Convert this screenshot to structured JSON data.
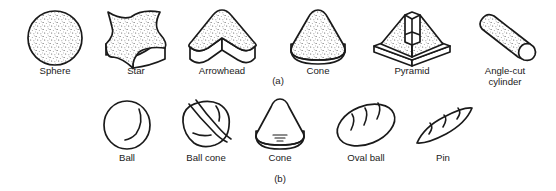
{
  "figure": {
    "background_color": "#ffffff",
    "ink_color": "#1a1a1a",
    "rows": [
      {
        "caption": "(a)",
        "caption_x": 278,
        "caption_y": 84,
        "shading": "stippled",
        "items": [
          {
            "label": "Sphere",
            "label_line2": "",
            "icon": "sphere-icon",
            "cx": 55,
            "label_y": 74
          },
          {
            "label": "Star",
            "label_line2": "",
            "icon": "extruded-star-icon",
            "cx": 136,
            "label_y": 74
          },
          {
            "label": "Arrowhead",
            "label_line2": "",
            "icon": "extruded-arrowhead-icon",
            "cx": 222,
            "label_y": 74
          },
          {
            "label": "Cone",
            "label_line2": "",
            "icon": "cone-on-base-icon",
            "cx": 318,
            "label_y": 74
          },
          {
            "label": "Pyramid",
            "label_line2": "",
            "icon": "truncated-pyramid-icon",
            "cx": 412,
            "label_y": 74
          },
          {
            "label": "Angle-cut",
            "label_line2": "cylinder",
            "icon": "angle-cut-cylinder-icon",
            "cx": 505,
            "label_y": 74
          }
        ]
      },
      {
        "caption": "(b)",
        "caption_y": 182,
        "shading": "outline",
        "items": [
          {
            "label": "Ball",
            "label_line2": "",
            "icon": "ball-icon",
            "cx": 127,
            "label_y": 161
          },
          {
            "label": "Ball cone",
            "label_line2": "",
            "icon": "ball-cone-icon",
            "cx": 206,
            "label_y": 161
          },
          {
            "label": "Cone",
            "label_line2": "",
            "icon": "cone-outline-icon",
            "cx": 280,
            "label_y": 161
          },
          {
            "label": "Oval ball",
            "label_line2": "",
            "icon": "oval-ball-icon",
            "cx": 366,
            "label_y": 161
          },
          {
            "label": "Pin",
            "label_line2": "",
            "icon": "pin-icon",
            "cx": 443,
            "label_y": 161
          }
        ]
      }
    ]
  }
}
